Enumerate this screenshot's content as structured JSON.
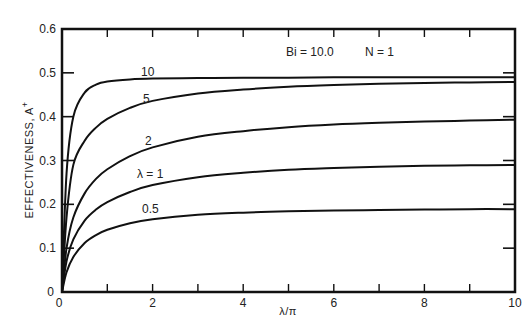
{
  "chart_data": {
    "type": "line",
    "title": "",
    "xlabel": "λ/π",
    "ylabel": "EFFECTIVENESS, A⁺",
    "xlim": [
      0,
      10
    ],
    "ylim": [
      0,
      0.6
    ],
    "grid": false,
    "x_ticks": [
      0,
      2,
      4,
      6,
      8,
      10
    ],
    "x_tick_labels": [
      "0",
      "2",
      "4",
      "6",
      "8",
      "10"
    ],
    "x_minor_ticks": [
      1,
      3,
      5,
      7,
      9
    ],
    "y_ticks": [
      0,
      0.1,
      0.2,
      0.3,
      0.4,
      0.5,
      0.6
    ],
    "y_tick_labels": [
      "0",
      "0.1",
      "0.2",
      "0.3",
      "0.4",
      "0.5",
      "0.6"
    ],
    "annotations": [
      "Bi = 10.0",
      "N = 1"
    ],
    "legend": "inline curve labels",
    "x": [
      0,
      0.1,
      0.25,
      0.5,
      0.75,
      1,
      1.5,
      2,
      3,
      4,
      5,
      6,
      7,
      8,
      9,
      10
    ],
    "series": [
      {
        "name": "10",
        "label": "10",
        "values": [
          0,
          0.27,
          0.4,
          0.455,
          0.473,
          0.48,
          0.485,
          0.487,
          0.488,
          0.489,
          0.489,
          0.49,
          0.49,
          0.49,
          0.49,
          0.49
        ]
      },
      {
        "name": "5",
        "label": "5",
        "values": [
          0,
          0.17,
          0.29,
          0.345,
          0.375,
          0.395,
          0.42,
          0.436,
          0.453,
          0.462,
          0.468,
          0.472,
          0.475,
          0.477,
          0.478,
          0.479
        ]
      },
      {
        "name": "2",
        "label": "2",
        "values": [
          0,
          0.1,
          0.17,
          0.225,
          0.258,
          0.28,
          0.31,
          0.33,
          0.354,
          0.367,
          0.376,
          0.382,
          0.386,
          0.389,
          0.391,
          0.393
        ]
      },
      {
        "name": "1",
        "label": "λ = 1",
        "values": [
          0,
          0.07,
          0.12,
          0.163,
          0.188,
          0.205,
          0.228,
          0.244,
          0.262,
          0.272,
          0.279,
          0.283,
          0.286,
          0.288,
          0.289,
          0.29
        ]
      },
      {
        "name": "0.5",
        "label": "0.5",
        "values": [
          0,
          0.045,
          0.08,
          0.112,
          0.13,
          0.142,
          0.157,
          0.166,
          0.176,
          0.181,
          0.184,
          0.186,
          0.187,
          0.188,
          0.189,
          0.189
        ]
      }
    ]
  },
  "labels": {
    "ylabel": "EFFECTIVENESS, A",
    "ylabel_sup": "+",
    "xlabel": "λ/π",
    "annot_bi": "Bi = 10.0",
    "annot_n": "N = 1",
    "curve_10": "10",
    "curve_5": "5",
    "curve_2": "2",
    "curve_1": "λ = 1",
    "curve_05": "0.5"
  }
}
